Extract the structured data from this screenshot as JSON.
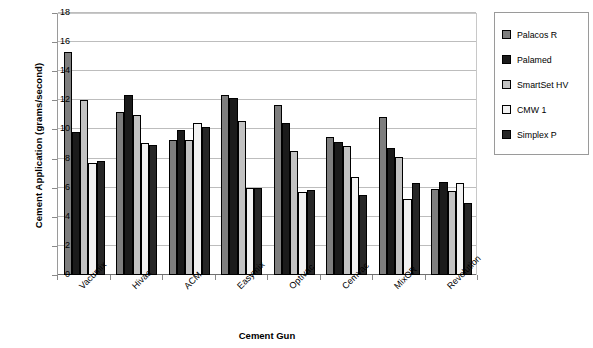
{
  "chart_data": {
    "type": "bar",
    "title": "",
    "xlabel": "Cement Gun",
    "ylabel": "Cement Application (grams/second)",
    "ylim": [
      0,
      18
    ],
    "ytick_step": 2,
    "yticks": [
      0,
      2,
      4,
      6,
      8,
      10,
      12,
      14,
      16,
      18
    ],
    "grid": true,
    "legend_position": "right-outside",
    "categories": [
      "Vacumix",
      "Hivac",
      "ACM",
      "Easymix",
      "Optivac",
      "Cemvac",
      "MixOR",
      "Revolution"
    ],
    "series": [
      {
        "name": "Palacos R",
        "color": "#7e7e7e",
        "values": [
          15.3,
          11.2,
          9.3,
          12.4,
          11.65,
          9.45,
          10.85,
          5.9
        ]
      },
      {
        "name": "Palamed",
        "color": "#1b1b1b",
        "values": [
          9.85,
          12.35,
          9.95,
          12.15,
          10.45,
          9.15,
          8.7,
          6.4
        ]
      },
      {
        "name": "SmartSet HV",
        "color": "#c2c2c2",
        "values": [
          12.0,
          11.0,
          9.3,
          10.6,
          8.5,
          8.85,
          8.1,
          5.75
        ]
      },
      {
        "name": "CMW 1",
        "color": "#f2f2f2",
        "values": [
          7.7,
          9.1,
          10.45,
          6.0,
          5.7,
          6.7,
          5.2,
          6.35
        ]
      },
      {
        "name": "Simplex P",
        "color": "#272727",
        "values": [
          7.8,
          8.9,
          10.2,
          6.0,
          5.85,
          5.5,
          6.3,
          4.95
        ]
      }
    ]
  }
}
